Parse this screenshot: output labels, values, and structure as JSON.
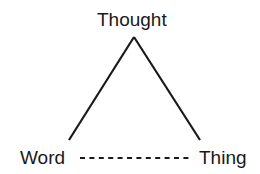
{
  "diagram": {
    "nodes": [
      {
        "id": "thought",
        "label": "Thought"
      },
      {
        "id": "word",
        "label": "Word"
      },
      {
        "id": "thing",
        "label": "Thing"
      }
    ],
    "edges": [
      {
        "from": "word",
        "to": "thought",
        "style": "solid"
      },
      {
        "from": "thought",
        "to": "thing",
        "style": "solid"
      },
      {
        "from": "word",
        "to": "thing",
        "style": "dashed"
      }
    ],
    "colors": {
      "line": "#1a1a1a",
      "text": "#1a1a1a",
      "background": "#ffffff"
    }
  }
}
